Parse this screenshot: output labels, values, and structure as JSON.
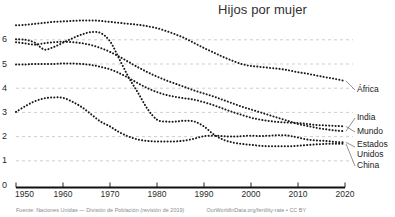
{
  "header": {
    "title": "Hijos por mujer"
  },
  "footer": {
    "source": "Fuente: Naciones Unidas — División de Población (revisión de 2019)",
    "credit": "OurWorldInData.org/fertility-rate • CC BY"
  },
  "colors": {
    "ink": "#1a1a1a",
    "grid": "#b9b9b9",
    "axis": "#111111",
    "muted": "#8a8a8a",
    "background": "#ffffff"
  },
  "axes": {
    "y_ticks": [
      "0",
      "1",
      "2",
      "3",
      "4",
      "5",
      "6"
    ],
    "x_ticks": [
      "1950",
      "1960",
      "1970",
      "1980",
      "1990",
      "2000",
      "2010",
      "2020"
    ]
  },
  "series_labels": {
    "africa": "África",
    "india": "India",
    "mundo": "Mundo",
    "estados_unidos_line1": "Estados",
    "estados_unidos_line2": "Unidos",
    "china": "China"
  },
  "chart_data": {
    "type": "line",
    "title": "Hijos por mujer",
    "xlabel": "",
    "ylabel": "",
    "xlim": [
      1950,
      2020
    ],
    "ylim": [
      0,
      6.8
    ],
    "grid": true,
    "legend": "right-inline-labels",
    "line_style": "dotted",
    "x": [
      1950,
      1952,
      1954,
      1956,
      1958,
      1960,
      1962,
      1964,
      1966,
      1968,
      1970,
      1972,
      1974,
      1976,
      1978,
      1980,
      1982,
      1984,
      1986,
      1988,
      1990,
      1992,
      1994,
      1996,
      1998,
      2000,
      2002,
      2004,
      2006,
      2008,
      2010,
      2012,
      2014,
      2016,
      2018,
      2020
    ],
    "series": [
      {
        "name": "África",
        "values": [
          6.6,
          6.62,
          6.66,
          6.7,
          6.74,
          6.76,
          6.78,
          6.8,
          6.8,
          6.78,
          6.74,
          6.7,
          6.66,
          6.62,
          6.56,
          6.48,
          6.36,
          6.22,
          6.06,
          5.86,
          5.66,
          5.48,
          5.3,
          5.14,
          5.0,
          4.92,
          4.88,
          4.84,
          4.8,
          4.74,
          4.66,
          4.6,
          4.52,
          4.45,
          4.38,
          4.3
        ]
      },
      {
        "name": "India",
        "values": [
          5.9,
          5.85,
          5.8,
          5.86,
          5.9,
          5.92,
          5.9,
          5.86,
          5.78,
          5.66,
          5.5,
          5.3,
          5.08,
          4.86,
          4.66,
          4.48,
          4.32,
          4.18,
          4.04,
          3.9,
          3.78,
          3.66,
          3.52,
          3.38,
          3.24,
          3.12,
          3.0,
          2.88,
          2.76,
          2.64,
          2.52,
          2.44,
          2.36,
          2.3,
          2.25,
          2.22
        ]
      },
      {
        "name": "Mundo",
        "values": [
          4.98,
          4.98,
          5.0,
          5.0,
          5.0,
          5.02,
          5.02,
          5.0,
          4.96,
          4.88,
          4.78,
          4.62,
          4.42,
          4.2,
          4.0,
          3.84,
          3.72,
          3.64,
          3.58,
          3.52,
          3.42,
          3.3,
          3.16,
          3.02,
          2.9,
          2.78,
          2.7,
          2.64,
          2.6,
          2.58,
          2.56,
          2.52,
          2.48,
          2.46,
          2.44,
          2.42
        ]
      },
      {
        "name": "Estados Unidos",
        "values": [
          3.02,
          3.26,
          3.46,
          3.58,
          3.62,
          3.6,
          3.44,
          3.22,
          2.92,
          2.62,
          2.42,
          2.18,
          2.0,
          1.88,
          1.82,
          1.8,
          1.8,
          1.8,
          1.84,
          1.92,
          2.02,
          2.04,
          2.02,
          2.0,
          2.02,
          2.04,
          2.02,
          2.04,
          2.06,
          2.04,
          1.96,
          1.88,
          1.84,
          1.82,
          1.78,
          1.76
        ]
      },
      {
        "name": "China",
        "values": [
          6.02,
          6.0,
          5.88,
          5.6,
          5.7,
          5.88,
          6.06,
          6.22,
          6.32,
          6.28,
          5.94,
          5.2,
          4.44,
          3.8,
          3.14,
          2.7,
          2.62,
          2.62,
          2.66,
          2.62,
          2.42,
          2.1,
          1.88,
          1.76,
          1.7,
          1.66,
          1.62,
          1.6,
          1.6,
          1.6,
          1.62,
          1.65,
          1.68,
          1.7,
          1.7,
          1.7
        ]
      }
    ],
    "end_annotations": [
      {
        "label": "África",
        "value": 4.3
      },
      {
        "label": "India",
        "value": 2.22
      },
      {
        "label": "Mundo",
        "value": 2.42
      },
      {
        "label": "Estados Unidos",
        "value": 1.76
      },
      {
        "label": "China",
        "value": 1.7
      }
    ]
  }
}
